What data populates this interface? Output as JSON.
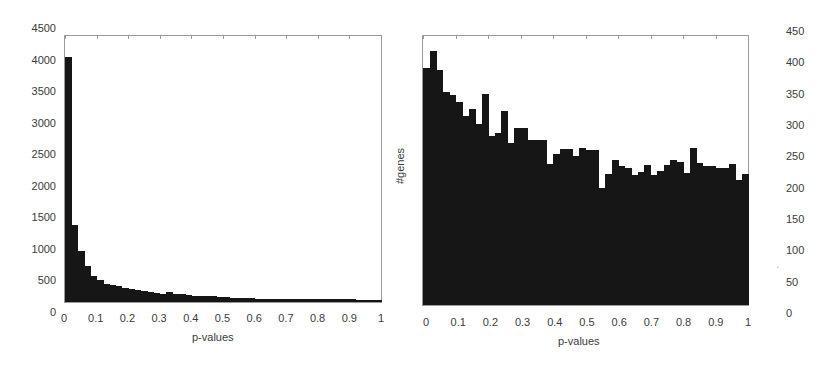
{
  "chart_data": [
    {
      "type": "bar",
      "title": "",
      "xlabel": "p-values",
      "ylabel": "",
      "xlim": [
        0,
        1
      ],
      "ylim": [
        0,
        4500
      ],
      "bin_width": 0.02,
      "x_ticks": [
        "0",
        "0.1",
        "0.2",
        "0.3",
        "0.4",
        "0.5",
        "0.6",
        "0.7",
        "0.8",
        "0.9",
        "1"
      ],
      "y_ticks": [
        "0",
        "500",
        "1000",
        "1500",
        "2000",
        "2500",
        "3000",
        "3500",
        "4000",
        "4500"
      ],
      "grid": false,
      "legend": null,
      "values": [
        4150,
        1415,
        994,
        745,
        586,
        523,
        455,
        439,
        417,
        391,
        375,
        364,
        338,
        322,
        317,
        296,
        333,
        296,
        296,
        275,
        259,
        254,
        264,
        264,
        243,
        238,
        232,
        228,
        224,
        222,
        220,
        218,
        216,
        215,
        214,
        213,
        212,
        211,
        210,
        205,
        208,
        212,
        210,
        208,
        206,
        205,
        204,
        203,
        202,
        200
      ]
    },
    {
      "type": "bar",
      "title": "",
      "xlabel": "p-values",
      "ylabel": "#genes",
      "xlim": [
        0,
        1
      ],
      "ylim": [
        0,
        450
      ],
      "bin_width": 0.02,
      "x_ticks": [
        "0",
        "0.1",
        "0.2",
        "0.3",
        "0.4",
        "0.5",
        "0.6",
        "0.7",
        "0.8",
        "0.9",
        "1"
      ],
      "y_ticks": [
        "0",
        "50",
        "100",
        "150",
        "200",
        "250",
        "300",
        "350",
        "400",
        "450"
      ],
      "y_axis_position": "right",
      "grid": false,
      "legend": null,
      "values": [
        397,
        425,
        394,
        357,
        352,
        342,
        318,
        330,
        305,
        354,
        285,
        290,
        327,
        274,
        299,
        299,
        279,
        279,
        279,
        239,
        256,
        263,
        263,
        252,
        265,
        262,
        262,
        200,
        222,
        246,
        235,
        232,
        221,
        226,
        237,
        221,
        227,
        238,
        246,
        243,
        225,
        266,
        241,
        235,
        235,
        233,
        232,
        239,
        213,
        223
      ]
    }
  ],
  "left_chart": {
    "xlabel": "p-values",
    "y_tick_labels": [
      "4500",
      "4000",
      "3500",
      "3000",
      "2500",
      "2000",
      "1500",
      "1000",
      "500",
      "0"
    ],
    "x_tick_labels": [
      "0",
      "0.1",
      "0.2",
      "0.3",
      "0.4",
      "0.5",
      "0.6",
      "0.7",
      "0.8",
      "0.9",
      "1"
    ]
  },
  "right_chart": {
    "xlabel": "p-values",
    "ylabel": "#genes",
    "y_tick_labels": [
      "450",
      "400",
      "350",
      "300",
      "250",
      "200",
      "150",
      "100",
      "50",
      "0"
    ],
    "x_tick_labels": [
      "0",
      "0.1",
      "0.2",
      "0.3",
      "0.4",
      "0.5",
      "0.6",
      "0.7",
      "0.8",
      "0.9",
      "1"
    ]
  },
  "colors": {
    "bar": "#161616",
    "frame": "#9a9a9a",
    "text": "#3a3a3a",
    "background": "#ffffff"
  }
}
